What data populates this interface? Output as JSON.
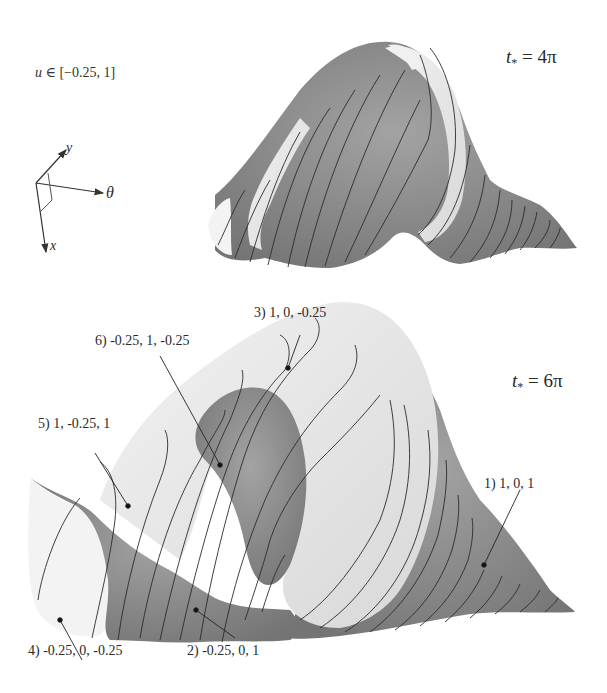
{
  "figure": {
    "domain_label": {
      "variable": "u",
      "symbol": "∈",
      "range": "[−0.25,  1]"
    },
    "axes_glyph": {
      "labels": {
        "y": "y",
        "theta": "θ",
        "x": "x"
      }
    },
    "panels": [
      {
        "id": "top",
        "title_var": "t",
        "title_sub": "*",
        "title_eq": " = 4π",
        "surface": "shell surface at t* = 4π"
      },
      {
        "id": "bottom",
        "title_var": "t",
        "title_sub": "*",
        "title_eq": " = 6π",
        "surface": "shell surface at t* = 6π",
        "annotations": [
          {
            "label": "1) 1, 0, 1"
          },
          {
            "label": "2) -0.25, 0, 1"
          },
          {
            "label": "3) 1, 0, -0.25"
          },
          {
            "label": "4) -0.25, 0, -0.25"
          },
          {
            "label": "5) 1, -0.25, 1"
          },
          {
            "label": "6) -0.25, 1, -0.25"
          }
        ]
      }
    ],
    "colors": {
      "dark_surface": "#8a8a8a",
      "light_surface": "#e6e6e6",
      "contour": "#2b2b2b",
      "background": "#ffffff"
    }
  }
}
